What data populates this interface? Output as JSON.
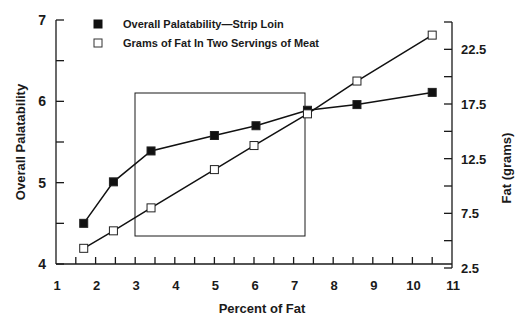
{
  "chart_data": {
    "type": "line",
    "title": "",
    "xlabel": "Percent of Fat",
    "ylabel": "Overall Palatability",
    "y2label": "Fat (grams)",
    "xlim": [
      1,
      11
    ],
    "ylim": [
      4,
      7
    ],
    "y2lim": [
      2.5,
      25
    ],
    "x_ticks": [
      "1",
      "2",
      "3",
      "4",
      "5",
      "6",
      "7",
      "8",
      "9",
      "10",
      "11"
    ],
    "y_ticks": [
      "4",
      "5",
      "6",
      "7"
    ],
    "y2_ticks": [
      "2.5",
      "7.5",
      "12.5",
      "17.5",
      "22.5"
    ],
    "grid": false,
    "legend_position": "top-left inside",
    "series": [
      {
        "name": "Overall Palatability—Strip Loin",
        "axis": "left",
        "marker": "filled-square",
        "x": [
          1.7,
          2.45,
          3.4,
          5.0,
          6.05,
          7.35,
          8.6,
          10.5
        ],
        "values": [
          4.5,
          5.01,
          5.39,
          5.58,
          5.7,
          5.89,
          5.96,
          6.11
        ]
      },
      {
        "name": "Grams of Fat In Two Servings of Meat",
        "axis": "right",
        "marker": "open-square",
        "x": [
          1.7,
          2.45,
          3.4,
          5.0,
          6.0,
          7.35,
          8.6,
          10.5
        ],
        "values": [
          4.3,
          5.9,
          8.0,
          11.5,
          13.7,
          16.6,
          19.6,
          23.8
        ]
      }
    ],
    "annotations": [
      {
        "type": "rectangle",
        "x_range": [
          3.0,
          7.3
        ],
        "y_range_left": [
          4.35,
          6.1
        ]
      }
    ]
  }
}
